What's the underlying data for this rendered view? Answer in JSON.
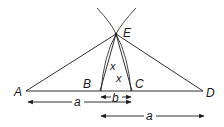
{
  "diagram": {
    "points": {
      "A": {
        "label": "A",
        "x": 26,
        "y": 91
      },
      "B": {
        "label": "B",
        "x": 100,
        "y": 91
      },
      "C": {
        "label": "C",
        "x": 132,
        "y": 91
      },
      "D": {
        "label": "D",
        "x": 203,
        "y": 91
      },
      "E": {
        "label": "E",
        "x": 116,
        "y": 34
      }
    },
    "angle_labels": [
      "x",
      "x"
    ],
    "measurements": {
      "a_left": {
        "label": "a",
        "from": "A",
        "to": "C"
      },
      "b": {
        "label": "b",
        "from": "B",
        "to": "C"
      },
      "a_right": {
        "label": "a",
        "from": "B",
        "to": "D"
      }
    },
    "colors": {
      "stroke": "#1a1a1a",
      "background": "#ffffff"
    }
  }
}
